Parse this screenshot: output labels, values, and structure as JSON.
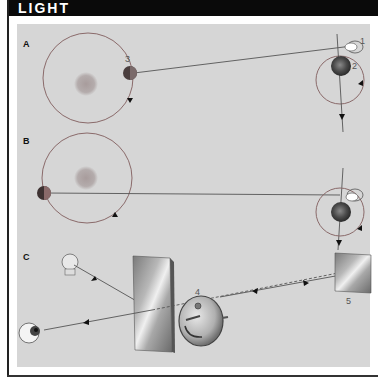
{
  "header": {
    "title": "LIGHT"
  },
  "panels": [
    {
      "id": "A",
      "label": "A",
      "numbers": [
        "3",
        "2",
        "1"
      ]
    },
    {
      "id": "B",
      "label": "B"
    },
    {
      "id": "C",
      "label": "C",
      "numbers": [
        "4",
        "5"
      ]
    }
  ],
  "colors": {
    "header_bg": "#0a0a0a",
    "header_text": "#ffffff",
    "panel_bg": "#d6d6d6",
    "orbit_line": "#8a6a6a",
    "ray_line": "#555555",
    "sun": "#b0a8a8"
  }
}
